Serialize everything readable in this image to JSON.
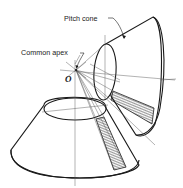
{
  "diagram": {
    "labels": {
      "pitch_cone": "Pitch cone",
      "common_apex": "Common apex",
      "apex_point": "O"
    },
    "elements": [
      {
        "name": "upper-pitch-cone",
        "description": "Pitch cone of the upper (tilted) gear, opening up-right from apex O"
      },
      {
        "name": "lower-pitch-cone",
        "description": "Pitch cone of the lower (horizontal) gear, opening downward from apex O"
      },
      {
        "name": "tooth-band-upper",
        "description": "Hatched tooth strip on upper cone"
      },
      {
        "name": "tooth-band-lower",
        "description": "Hatched tooth strip on lower cone"
      },
      {
        "name": "axis-lines",
        "description": "Thin construction/axis lines radiating from common apex O"
      }
    ],
    "colors": {
      "stroke": "#1a1a1a",
      "construction": "#555555",
      "background": "#ffffff"
    }
  }
}
